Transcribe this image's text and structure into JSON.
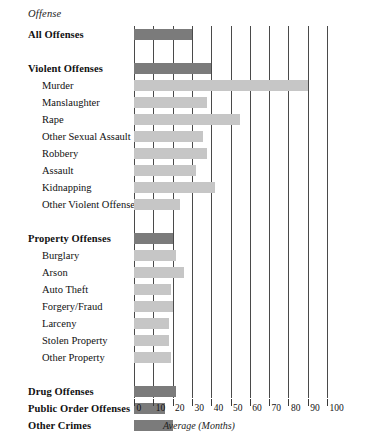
{
  "header": {
    "column_title": "Offense"
  },
  "axis": {
    "title": "Average (Months)",
    "ticks": [
      0,
      10,
      20,
      30,
      40,
      50,
      60,
      70,
      80,
      90,
      100
    ],
    "tick_labels": [
      "0",
      "10",
      "20",
      "30",
      "40",
      "50",
      "60",
      "70",
      "80",
      "90",
      "100"
    ]
  },
  "colors": {
    "bar_group": "#7b7b7b",
    "bar_sub": "#c6c6c6",
    "gridline": "#4a4a4a",
    "text": "#111111",
    "background": "#ffffff"
  },
  "rows": [
    {
      "label": "All Offenses",
      "level": "group",
      "value": 30
    },
    {
      "label": "",
      "level": "spacer",
      "value": null
    },
    {
      "label": "Violent Offenses",
      "level": "group",
      "value": 40
    },
    {
      "label": "Murder",
      "level": "sub",
      "value": 90
    },
    {
      "label": "Manslaughter",
      "level": "sub",
      "value": 38
    },
    {
      "label": "Rape",
      "level": "sub",
      "value": 55
    },
    {
      "label": "Other Sexual Assault",
      "level": "sub",
      "value": 36
    },
    {
      "label": "Robbery",
      "level": "sub",
      "value": 38
    },
    {
      "label": "Assault",
      "level": "sub",
      "value": 32
    },
    {
      "label": "Kidnapping",
      "level": "sub",
      "value": 42
    },
    {
      "label": "Other Violent Offenses",
      "level": "sub",
      "value": 24
    },
    {
      "label": "",
      "level": "spacer",
      "value": null
    },
    {
      "label": "Property Offenses",
      "level": "group",
      "value": 20
    },
    {
      "label": "Burglary",
      "level": "sub",
      "value": 22
    },
    {
      "label": "Arson",
      "level": "sub",
      "value": 26
    },
    {
      "label": "Auto Theft",
      "level": "sub",
      "value": 19
    },
    {
      "label": "Forgery/Fraud",
      "level": "sub",
      "value": 20
    },
    {
      "label": "Larceny",
      "level": "sub",
      "value": 18
    },
    {
      "label": "Stolen Property",
      "level": "sub",
      "value": 18
    },
    {
      "label": "Other Property",
      "level": "sub",
      "value": 19
    },
    {
      "label": "",
      "level": "spacer",
      "value": null
    },
    {
      "label": "Drug Offenses",
      "level": "group",
      "value": 22
    },
    {
      "label": "Public Order Offenses",
      "level": "group",
      "value": 16
    },
    {
      "label": "Other Crimes",
      "level": "group",
      "value": 20
    }
  ],
  "chart_data": {
    "type": "bar",
    "orientation": "horizontal",
    "title": "",
    "subtitle": "",
    "xlabel": "Average (Months)",
    "ylabel": "Offense",
    "xlim": [
      0,
      100
    ],
    "ylim": null,
    "grid": "vertical-only",
    "legend": null,
    "categories": [
      "All Offenses",
      "Violent Offenses",
      "Murder",
      "Manslaughter",
      "Rape",
      "Other Sexual Assault",
      "Robbery",
      "Assault",
      "Kidnapping",
      "Other Violent Offenses",
      "Property Offenses",
      "Burglary",
      "Arson",
      "Auto Theft",
      "Forgery/Fraud",
      "Larceny",
      "Stolen Property",
      "Other Property",
      "Drug Offenses",
      "Public Order Offenses",
      "Other Crimes"
    ],
    "values": [
      30,
      40,
      90,
      38,
      55,
      36,
      38,
      32,
      42,
      24,
      20,
      22,
      26,
      19,
      20,
      18,
      18,
      19,
      22,
      16,
      20
    ],
    "xticks": [
      0,
      10,
      20,
      30,
      40,
      50,
      60,
      70,
      80,
      90,
      100
    ],
    "series": [
      {
        "name": "Average sentence length (months)",
        "values": [
          30,
          40,
          90,
          38,
          55,
          36,
          38,
          32,
          42,
          24,
          20,
          22,
          26,
          19,
          20,
          18,
          18,
          19,
          22,
          16,
          20
        ]
      }
    ]
  }
}
